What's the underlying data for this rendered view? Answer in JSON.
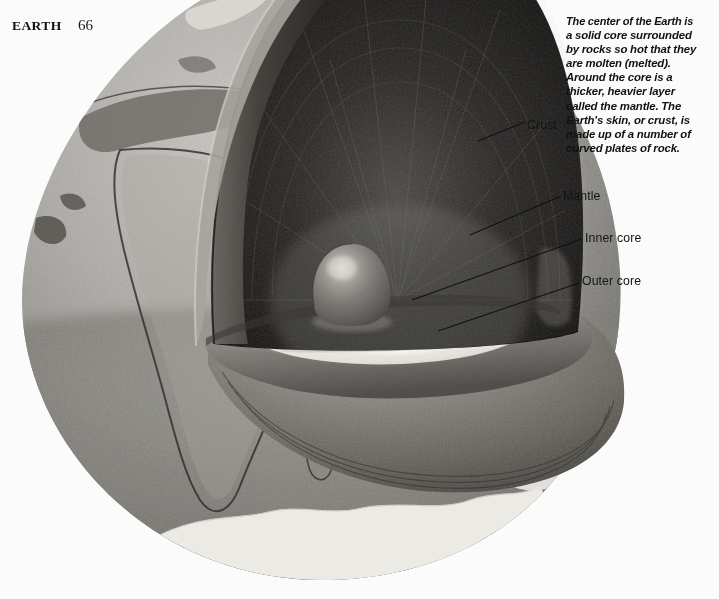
{
  "header": {
    "book_title": "EARTH",
    "page_number": "66"
  },
  "caption": {
    "lines": [
      "The center of the Earth is",
      "a solid core surrounded",
      "by rocks so hot that they",
      "are molten (melted).",
      "Around the core is a",
      "thicker, heavier layer",
      "called the mantle. The",
      "Earth's skin, or crust, is",
      "made up of a number of",
      "curved plates of rock."
    ],
    "line_0": "The center of the Earth is",
    "line_1": "a solid core surrounded",
    "line_2": "by rocks so hot that they",
    "line_3": "are molten (melted).",
    "line_4": "Around the core is a",
    "line_5": "thicker, heavier layer",
    "line_6": "called the mantle. The",
    "line_7": "Earth's skin, or crust, is",
    "line_8": "made up of a number of",
    "line_9": "curved plates of rock."
  },
  "labels": {
    "crust": "Crust",
    "mantle": "Mantle",
    "inner_core": "Inner core",
    "outer_core": "Outer core"
  },
  "illustration": {
    "subject": "earth-cutaway-globe",
    "description": "Cutaway globe of the Earth with a wedge removed from the upper right, revealing the dark mantle dome, the pale outer core and the small rounded inner core.",
    "layers": [
      {
        "name": "crust",
        "appearance": "textured grey sphere surface with continents and polar ice"
      },
      {
        "name": "mantle",
        "appearance": "very dark radially streaked dome forming the cut interior"
      },
      {
        "name": "outer core",
        "appearance": "pale near-white mottled ellipse on the cut plane"
      },
      {
        "name": "inner core",
        "appearance": "small dark rounded ball with a bright highlight"
      }
    ]
  },
  "colors": {
    "background": "#fbfbfb",
    "text": "#141414",
    "crust_light": "#b9b7b2",
    "crust_mid": "#8e8c88",
    "crust_dark": "#5d5c59",
    "mantle_dark": "#1d1c1b",
    "mantle_mid": "#4a4845",
    "outer_core_light": "#f2f0ec",
    "inner_core": "#6b6965",
    "ice_white": "#eceae6"
  }
}
